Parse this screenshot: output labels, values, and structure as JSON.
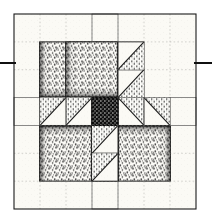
{
  "figure": {
    "kind": "quilt-block-diagram",
    "rendering": "scanned line illustration, stippled halftone fills",
    "canvas": {
      "width": 212,
      "height": 222,
      "background": "#ffffff"
    }
  },
  "block": {
    "name": "bears-paw",
    "x": 14,
    "y": 14,
    "width": 182,
    "height": 195,
    "grid_units": 7,
    "unit_width": 26,
    "unit_height": 27.857,
    "outline_color": "#1a1a1a",
    "outline_width": 1
  },
  "palette": {
    "background": "#ffffff",
    "light": "#f7f6f1",
    "dark_stipple": "#3a3a3a",
    "center_dark": "#141414",
    "ink": "#1a1a1a",
    "seam_line": "#6e6e6e"
  },
  "annotation_line": {
    "name": "horizontal-guide-line",
    "y": 63,
    "thickness": 2,
    "color": "#101010",
    "left_segment": {
      "x1": 0,
      "x2": 16
    },
    "right_segment": {
      "x1": 194,
      "x2": 212
    }
  },
  "structure": {
    "description": "Four mirrored bear-paw units arranged around a cross of light sashing with one dark center square.",
    "paws": [
      {
        "name": "paw-top-left",
        "corner": "top-left",
        "col": 0,
        "row": 0,
        "mirror_x": false,
        "mirror_y": false
      },
      {
        "name": "paw-top-right",
        "corner": "top-right",
        "col": 4,
        "row": 0,
        "mirror_x": true,
        "mirror_y": false
      },
      {
        "name": "paw-bottom-left",
        "corner": "bottom-left",
        "col": 0,
        "row": 4,
        "mirror_x": false,
        "mirror_y": true
      },
      {
        "name": "paw-bottom-right",
        "corner": "bottom-right",
        "col": 4,
        "row": 4,
        "mirror_x": true,
        "mirror_y": true
      }
    ],
    "paw_parts": [
      {
        "name": "paw-pad",
        "count": 4,
        "shape": "square",
        "units": 2,
        "fill": "dark-stipple"
      },
      {
        "name": "paw-claw-hst",
        "count": 16,
        "shape": "half-square-triangle",
        "units": 1,
        "fill": "dark-dotted"
      },
      {
        "name": "paw-corner-square",
        "count": 4,
        "shape": "square",
        "units": 1,
        "fill": "light"
      }
    ],
    "sashing": [
      {
        "name": "sashing-vertical",
        "col": 3,
        "rows": "0-6",
        "fill": "light"
      },
      {
        "name": "sashing-horizontal",
        "row": 3,
        "cols": "0-6",
        "fill": "light"
      }
    ],
    "center": {
      "name": "center-square",
      "col": 3,
      "row": 3,
      "fill": "center-dark"
    }
  },
  "labels": {
    "figure_caption": ""
  }
}
